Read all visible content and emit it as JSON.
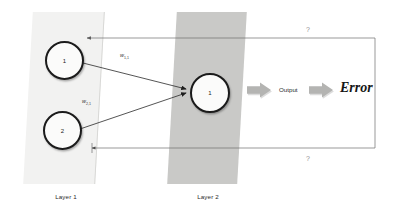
{
  "diagram": {
    "background": "#ffffff"
  },
  "layers": [
    {
      "id": "layer1",
      "caption": "Layer 1",
      "fill": "#f2f2f1",
      "neurons": [
        {
          "id": "l1-1",
          "label": "1"
        },
        {
          "id": "l1-2",
          "label": "2"
        }
      ]
    },
    {
      "id": "layer2",
      "caption": "Layer 2",
      "fill": "#c9c9c7",
      "neurons": [
        {
          "id": "l2-1",
          "label": "1"
        }
      ]
    }
  ],
  "weights": [
    {
      "id": "w11",
      "symbol": "w",
      "subscript": "1,1"
    },
    {
      "id": "w21",
      "symbol": "w",
      "subscript": "2,1"
    }
  ],
  "flow": {
    "output_label": "Output",
    "error_label": "Error",
    "arrow_color": "#b4b4b2"
  },
  "feedback": {
    "top_marker": "?",
    "bottom_marker": "?",
    "line_color": "#6d6d6d"
  }
}
